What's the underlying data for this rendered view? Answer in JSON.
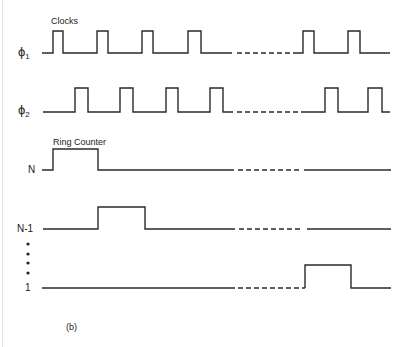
{
  "figure": {
    "caption": "(b)",
    "clock_heading": "Clocks",
    "counter_heading": "Ring Counter",
    "ellipsis": "••••",
    "signals": [
      {
        "id": "phi1",
        "label": "ϕ",
        "subscript": "1"
      },
      {
        "id": "phi2",
        "label": "ϕ",
        "subscript": "2"
      },
      {
        "id": "n",
        "label": "N",
        "subscript": ""
      },
      {
        "id": "n-minus-1",
        "label": "N-1",
        "subscript": ""
      },
      {
        "id": "one",
        "label": "1",
        "subscript": ""
      }
    ]
  },
  "colors": {
    "line": "#2a2a2a",
    "background": "#ffffff"
  }
}
